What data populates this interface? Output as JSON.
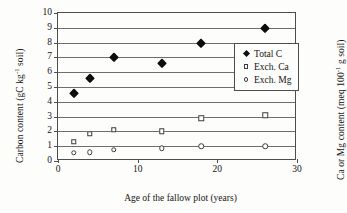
{
  "chart_data": {
    "type": "scatter",
    "title": "",
    "xlabel": "Age of the fallow plot (years)",
    "ylabel_left": "Carbon content (gC kg",
    "ylabel_left_sup": "-1",
    "ylabel_left_tail": " soil)",
    "ylabel_right": "Ca or Mg content (meq 100",
    "ylabel_right_sup": "-1",
    "ylabel_right_tail": " g soil)",
    "xlim": [
      0,
      30
    ],
    "ylim": [
      0,
      10
    ],
    "xticks": [
      0,
      10,
      20,
      30
    ],
    "xtick_labels": [
      "0",
      "10",
      "20",
      "30"
    ],
    "yticks": [
      0,
      1,
      2,
      3,
      4,
      5,
      6,
      7,
      8,
      9,
      10
    ],
    "ytick_labels": [
      "0",
      "1",
      "2",
      "3",
      "4",
      "5",
      "6",
      "7",
      "8",
      "9",
      "10"
    ],
    "grid": true,
    "grid_axis": "y",
    "legend_position": "center-right",
    "series": [
      {
        "name": "Total C",
        "marker": "filled-diamond",
        "color": "#0d0d0d",
        "points": [
          {
            "x": 2,
            "y": 4.6
          },
          {
            "x": 4,
            "y": 5.6
          },
          {
            "x": 7,
            "y": 7.0
          },
          {
            "x": 13,
            "y": 6.6
          },
          {
            "x": 18,
            "y": 8.0
          },
          {
            "x": 26,
            "y": 9.0
          }
        ]
      },
      {
        "name": "Exch. Ca",
        "marker": "open-square",
        "color": "#3d3d3d",
        "points": [
          {
            "x": 2,
            "y": 1.3
          },
          {
            "x": 4,
            "y": 1.85
          },
          {
            "x": 7,
            "y": 2.1
          },
          {
            "x": 13,
            "y": 2.0
          },
          {
            "x": 18,
            "y": 2.9
          },
          {
            "x": 26,
            "y": 3.1
          }
        ]
      },
      {
        "name": "Exch. Mg",
        "marker": "open-circle",
        "color": "#3d3d3d",
        "points": [
          {
            "x": 2,
            "y": 0.55
          },
          {
            "x": 4,
            "y": 0.6
          },
          {
            "x": 7,
            "y": 0.75
          },
          {
            "x": 13,
            "y": 0.85
          },
          {
            "x": 18,
            "y": 1.0
          },
          {
            "x": 26,
            "y": 1.0
          }
        ]
      }
    ]
  },
  "legend": {
    "items": [
      {
        "label": "Total C",
        "marker": "filled-diamond"
      },
      {
        "label": "Exch. Ca",
        "marker": "open-square"
      },
      {
        "label": "Exch. Mg",
        "marker": "open-circle"
      }
    ]
  }
}
